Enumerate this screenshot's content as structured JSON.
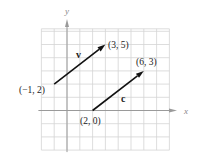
{
  "figure": {
    "axes": {
      "x_label": "x",
      "y_label": "y"
    },
    "grid": {
      "x_min": -2,
      "x_max": 8,
      "y_min": -3,
      "y_max": 6,
      "step": 1
    },
    "vectors": [
      {
        "name": "v",
        "from": [
          -1,
          2
        ],
        "to": [
          3,
          5
        ],
        "from_label": "(−1, 2)",
        "to_label": "(3, 5)"
      },
      {
        "name": "c",
        "from": [
          2,
          0
        ],
        "to": [
          6,
          3
        ],
        "from_label": "(2, 0)",
        "to_label": "(6, 3)"
      }
    ],
    "colors": {
      "grid": "#d4d4d4",
      "axis": "#9a9a9a",
      "vector": "#111111"
    }
  }
}
